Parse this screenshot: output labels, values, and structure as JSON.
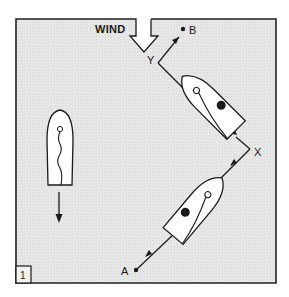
{
  "diagram": {
    "panel_number": "1",
    "wind_label": "WIND",
    "points": {
      "A": "A",
      "B": "B",
      "X": "X",
      "Y": "Y"
    },
    "colors": {
      "background": "#e6e6e6",
      "frame": "#222222",
      "boat_fill": "#ffffff",
      "stroke": "#1a1a1a"
    },
    "elements": [
      {
        "id": "boat-lower",
        "description": "Sailboat on starboard tack between A and X"
      },
      {
        "id": "boat-upper",
        "description": "Sailboat on port tack between X and Y"
      },
      {
        "id": "boat-left",
        "description": "Sailboat heading downwind with luffing sail"
      }
    ]
  }
}
